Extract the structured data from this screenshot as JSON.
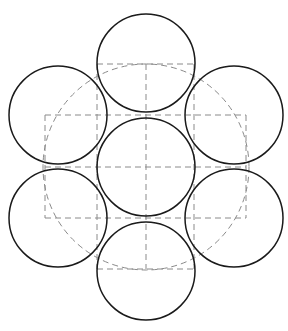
{
  "diagram": {
    "type": "hexagonal circle packing",
    "canvas": {
      "width": 288,
      "height": 331,
      "background": "#ffffff"
    },
    "colors": {
      "solid_stroke": "#1a1a1a",
      "dashed_stroke": "#8a8a8a"
    },
    "circle_radius": 49,
    "circles": [
      {
        "id": "center",
        "cx": 146,
        "cy": 167
      },
      {
        "id": "top",
        "cx": 146,
        "cy": 63
      },
      {
        "id": "bottom",
        "cx": 146,
        "cy": 271
      },
      {
        "id": "upper-left",
        "cx": 58,
        "cy": 115
      },
      {
        "id": "lower-left",
        "cx": 58,
        "cy": 218
      },
      {
        "id": "upper-right",
        "cx": 234,
        "cy": 115
      },
      {
        "id": "lower-right",
        "cx": 234,
        "cy": 218
      }
    ],
    "dashed_circle": {
      "cx": 146,
      "cy": 167,
      "r": 103
    },
    "dashed_lines": [
      {
        "id": "top-horizontal",
        "x1": 97,
        "y1": 64,
        "x2": 194,
        "y2": 64
      },
      {
        "id": "bottom-horizontal",
        "x1": 97,
        "y1": 269,
        "x2": 194,
        "y2": 269
      },
      {
        "id": "center-horizontal",
        "x1": 45,
        "y1": 167,
        "x2": 246,
        "y2": 167
      },
      {
        "id": "center-vertical",
        "x1": 146,
        "y1": 64,
        "x2": 146,
        "y2": 269
      },
      {
        "id": "left-inner-vertical",
        "x1": 97,
        "y1": 64,
        "x2": 97,
        "y2": 269
      },
      {
        "id": "right-inner-vertical",
        "x1": 194,
        "y1": 64,
        "x2": 194,
        "y2": 269
      },
      {
        "id": "rect-top",
        "x1": 45,
        "y1": 115,
        "x2": 246,
        "y2": 115
      },
      {
        "id": "rect-bottom",
        "x1": 45,
        "y1": 218,
        "x2": 246,
        "y2": 218
      },
      {
        "id": "rect-left",
        "x1": 45,
        "y1": 115,
        "x2": 45,
        "y2": 218
      },
      {
        "id": "rect-right",
        "x1": 246,
        "y1": 115,
        "x2": 246,
        "y2": 218
      }
    ]
  }
}
